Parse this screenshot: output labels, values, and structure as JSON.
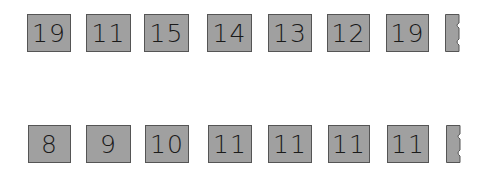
{
  "rows": [
    {
      "cards": [
        "19",
        "11",
        "15",
        "14",
        "13",
        "12",
        "19"
      ],
      "trailing": "partial-card"
    },
    {
      "cards": [
        "8",
        "9",
        "10",
        "11",
        "11",
        "11",
        "11"
      ],
      "trailing": "partial-card"
    }
  ],
  "colors": {
    "card_fill": "#a0a0a0",
    "card_border": "#555555",
    "text": "#1a1a1a",
    "background": "#ffffff"
  }
}
